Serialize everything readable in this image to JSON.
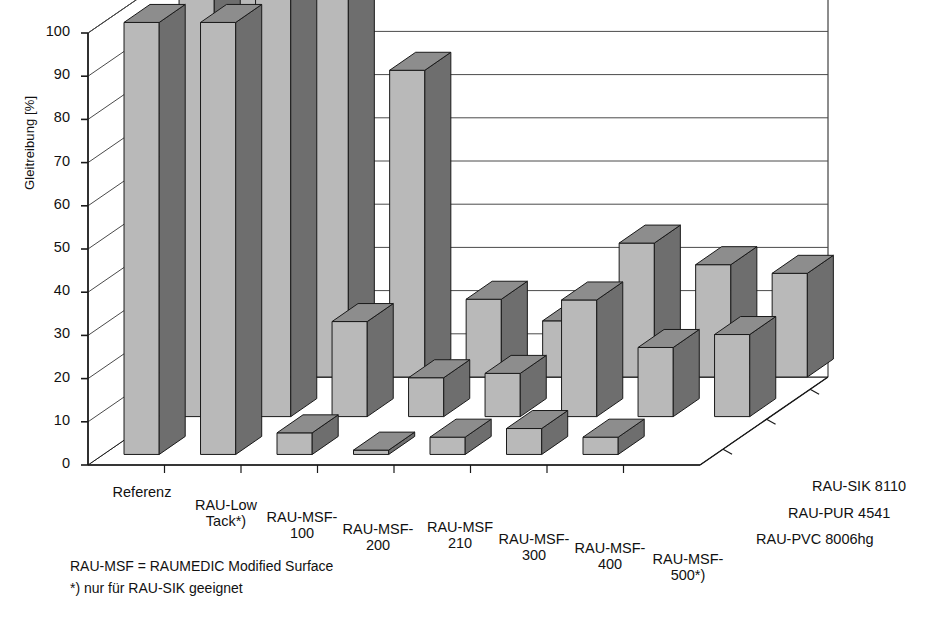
{
  "chart_data": {
    "type": "bar",
    "subtype": "3d-grouped-column",
    "title": "",
    "xlabel": "",
    "ylabel": "Gleitreibung [%]",
    "ylim": [
      0,
      100
    ],
    "yticks": [
      0,
      10,
      20,
      30,
      40,
      50,
      60,
      70,
      80,
      90,
      100
    ],
    "ytick_labels": [
      "0",
      "10",
      "20",
      "30",
      "40",
      "50",
      "60",
      "70",
      "80",
      "90",
      "100"
    ],
    "grid": true,
    "legend_position": "depth-axis-right",
    "categories": [
      "Referenz",
      "RAU-Low\nTack*)",
      "RAU-MSF-\n100",
      "RAU-MSF-\n200",
      "RAU-MSF\n210",
      "RAU-MSF-\n300",
      "RAU-MSF-\n400",
      "RAU-MSF-\n500*)"
    ],
    "depth_categories": [
      "RAU-SIK 8110",
      "RAU-PUR 4541",
      "RAU-PVC 8006hg"
    ],
    "series": [
      {
        "name": "RAU-SIK 8110",
        "values": [
          100,
          100,
          71,
          18,
          13,
          31,
          26,
          24
        ]
      },
      {
        "name": "RAU-PUR 4541",
        "values": [
          100,
          100,
          22,
          9,
          10,
          27,
          16,
          19
        ]
      },
      {
        "name": "RAU-PVC 8006hg",
        "values": [
          100,
          100,
          5,
          1,
          4,
          6,
          4,
          0
        ]
      }
    ],
    "annotations": [
      "RAU-MSF = RAUMEDIC Modified Surface",
      "*) nur für RAU-SIK geeignet"
    ],
    "colors": {
      "series_light": "#b9b9b9",
      "series_dark": "#6e6e6e",
      "series_top": "#8d8d8d",
      "axis": "#1a1a1a",
      "grid": "#4a4a4a",
      "background": "#ffffff"
    }
  },
  "footnotes": {
    "line1": "RAU-MSF = RAUMEDIC Modified Surface",
    "line2": "*) nur für RAU-SIK geeignet"
  },
  "axes": {
    "y_title": "Gleitreibung [%]"
  }
}
